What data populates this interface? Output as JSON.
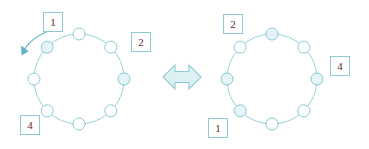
{
  "figure": {
    "background_color": "#ffffff",
    "ring_stroke_color": "#8fc9d4",
    "node_stroke_color": "#7ec3d0",
    "node_fill_color": "#ffffff",
    "label_text_color": "#5c2a1e",
    "label_border_color": "#8fc9d4",
    "arrow_color": "#5bb3c4",
    "equivalence_fill_color": "#ddf0f4"
  },
  "left_diagram": {
    "name": "left-ring",
    "node_count": 8,
    "center_x": 79,
    "center_y": 79,
    "radius": 45,
    "labels": [
      {
        "id": "left-label-1",
        "text": "1",
        "x": 43,
        "y": 12
      },
      {
        "id": "left-label-2",
        "text": "2",
        "x": 131,
        "y": 32
      },
      {
        "id": "left-label-4",
        "text": "4",
        "x": 20,
        "y": 115
      }
    ],
    "rotation_arrow": {
      "name": "rotation-arrow",
      "direction": "counter-clockwise",
      "from_x": 58,
      "from_y": 28,
      "to_x": 22,
      "to_y": 52
    }
  },
  "right_diagram": {
    "name": "right-ring",
    "node_count": 8,
    "center_x": 272,
    "center_y": 79,
    "radius": 45,
    "labels": [
      {
        "id": "right-label-2",
        "text": "2",
        "x": 223,
        "y": 14
      },
      {
        "id": "right-label-4",
        "text": "4",
        "x": 330,
        "y": 56
      },
      {
        "id": "right-label-1",
        "text": "1",
        "x": 208,
        "y": 118
      }
    ]
  },
  "equivalence": {
    "name": "equivalence-arrow",
    "symbol": "double-headed-arrow",
    "unicode": "⟺",
    "center_x": 182,
    "center_y": 77,
    "width": 38,
    "height": 26
  }
}
